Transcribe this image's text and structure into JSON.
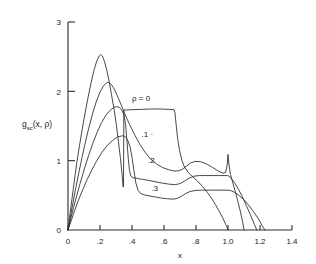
{
  "figure": {
    "background_color": "#ffffff",
    "ink_color": "#333333"
  },
  "chart_data": {
    "type": "line",
    "title": "",
    "xlabel": "x",
    "ylabel": "g_sc(x, ρ)",
    "ylabel_main": "g",
    "ylabel_subscript": "sc",
    "ylabel_args": "(x, ρ)",
    "xlim": [
      0,
      1.4
    ],
    "ylim": [
      0,
      3
    ],
    "grid": false,
    "legend_position": "inline-curve-labels",
    "xticks": [
      0,
      0.2,
      0.4,
      0.6,
      0.8,
      1.0,
      1.2,
      1.4
    ],
    "xticklabels": [
      "0",
      ".2",
      ".4",
      ".6",
      ".8",
      "1.0",
      "1.2",
      "1.4"
    ],
    "yticks": [
      0,
      1,
      2,
      3
    ],
    "yticklabels": [
      "0",
      "1",
      "2",
      "3"
    ],
    "annotations": [
      {
        "text": "ρ = 0",
        "x": 0.4,
        "y": 1.86
      },
      {
        "text": ".1 ·",
        "x": 0.46,
        "y": 1.34
      },
      {
        "text": ".2",
        "x": 0.5,
        "y": 0.97
      },
      {
        "text": ".3",
        "x": 0.52,
        "y": 0.56
      }
    ],
    "series": [
      {
        "name": "ρ = 0",
        "label": "ρ = 0",
        "peak_x": 0.205,
        "peak_y": 2.53,
        "plateau_y": 1.73,
        "plateau_x_range": [
          0.345,
          0.665
        ],
        "end_x": 1.0,
        "points": [
          [
            0.0,
            0.0
          ],
          [
            0.012,
            0.22
          ],
          [
            0.025,
            0.45
          ],
          [
            0.04,
            0.72
          ],
          [
            0.055,
            0.97
          ],
          [
            0.072,
            1.22
          ],
          [
            0.09,
            1.47
          ],
          [
            0.108,
            1.7
          ],
          [
            0.126,
            1.92
          ],
          [
            0.145,
            2.13
          ],
          [
            0.163,
            2.31
          ],
          [
            0.18,
            2.44
          ],
          [
            0.195,
            2.51
          ],
          [
            0.205,
            2.53
          ],
          [
            0.215,
            2.51
          ],
          [
            0.228,
            2.43
          ],
          [
            0.243,
            2.3
          ],
          [
            0.258,
            2.13
          ],
          [
            0.272,
            1.95
          ],
          [
            0.288,
            1.74
          ],
          [
            0.302,
            1.52
          ],
          [
            0.315,
            1.28
          ],
          [
            0.328,
            1.03
          ],
          [
            0.338,
            0.8
          ],
          [
            0.344,
            0.62
          ],
          [
            0.347,
            0.62
          ],
          [
            0.349,
            1.73
          ],
          [
            0.4,
            1.735
          ],
          [
            0.46,
            1.74
          ],
          [
            0.52,
            1.745
          ],
          [
            0.58,
            1.745
          ],
          [
            0.63,
            1.74
          ],
          [
            0.662,
            1.735
          ],
          [
            0.668,
            1.7
          ],
          [
            0.676,
            1.52
          ],
          [
            0.685,
            1.32
          ],
          [
            0.697,
            1.15
          ],
          [
            0.712,
            1.0
          ],
          [
            0.73,
            0.9
          ],
          [
            0.752,
            0.83
          ],
          [
            0.778,
            0.77
          ],
          [
            0.808,
            0.71
          ],
          [
            0.84,
            0.63
          ],
          [
            0.872,
            0.54
          ],
          [
            0.905,
            0.43
          ],
          [
            0.938,
            0.3
          ],
          [
            0.968,
            0.17
          ],
          [
            0.99,
            0.06
          ],
          [
            1.0,
            0.0
          ]
        ]
      },
      {
        "name": "ρ = .1",
        "label": ".1",
        "peak_x": 0.253,
        "peak_y": 2.13,
        "end_x": 1.1,
        "points": [
          [
            0.0,
            0.0
          ],
          [
            0.014,
            0.18
          ],
          [
            0.03,
            0.38
          ],
          [
            0.048,
            0.6
          ],
          [
            0.068,
            0.83
          ],
          [
            0.088,
            1.05
          ],
          [
            0.11,
            1.28
          ],
          [
            0.132,
            1.49
          ],
          [
            0.155,
            1.69
          ],
          [
            0.178,
            1.86
          ],
          [
            0.2,
            1.99
          ],
          [
            0.222,
            2.08
          ],
          [
            0.24,
            2.12
          ],
          [
            0.253,
            2.13
          ],
          [
            0.266,
            2.11
          ],
          [
            0.282,
            2.06
          ],
          [
            0.298,
            1.99
          ],
          [
            0.315,
            1.9
          ],
          [
            0.335,
            1.79
          ],
          [
            0.358,
            1.66
          ],
          [
            0.385,
            1.52
          ],
          [
            0.415,
            1.38
          ],
          [
            0.448,
            1.24
          ],
          [
            0.482,
            1.12
          ],
          [
            0.518,
            1.02
          ],
          [
            0.555,
            0.95
          ],
          [
            0.592,
            0.9
          ],
          [
            0.628,
            0.87
          ],
          [
            0.662,
            0.85
          ],
          [
            0.692,
            0.855
          ],
          [
            0.715,
            0.875
          ],
          [
            0.74,
            0.92
          ],
          [
            0.765,
            0.965
          ],
          [
            0.795,
            0.99
          ],
          [
            0.83,
            0.985
          ],
          [
            0.868,
            0.95
          ],
          [
            0.905,
            0.9
          ],
          [
            0.94,
            0.85
          ],
          [
            0.968,
            0.82
          ],
          [
            0.985,
            0.83
          ],
          [
            0.995,
            0.94
          ],
          [
            1.0,
            1.09
          ],
          [
            1.006,
            0.94
          ],
          [
            1.016,
            0.8
          ],
          [
            1.03,
            0.68
          ],
          [
            1.046,
            0.55
          ],
          [
            1.062,
            0.41
          ],
          [
            1.078,
            0.26
          ],
          [
            1.092,
            0.11
          ],
          [
            1.1,
            0.0
          ]
        ]
      },
      {
        "name": "ρ = .2",
        "label": ".2",
        "peak_x": 0.305,
        "peak_y": 1.78,
        "end_x": 1.18,
        "points": [
          [
            0.0,
            0.0
          ],
          [
            0.016,
            0.15
          ],
          [
            0.034,
            0.32
          ],
          [
            0.055,
            0.5
          ],
          [
            0.078,
            0.69
          ],
          [
            0.102,
            0.88
          ],
          [
            0.128,
            1.07
          ],
          [
            0.155,
            1.25
          ],
          [
            0.182,
            1.41
          ],
          [
            0.21,
            1.55
          ],
          [
            0.238,
            1.66
          ],
          [
            0.265,
            1.73
          ],
          [
            0.288,
            1.77
          ],
          [
            0.305,
            1.78
          ],
          [
            0.32,
            1.77
          ],
          [
            0.336,
            1.73
          ],
          [
            0.35,
            1.66
          ],
          [
            0.36,
            1.52
          ],
          [
            0.368,
            1.3
          ],
          [
            0.376,
            1.05
          ],
          [
            0.384,
            0.86
          ],
          [
            0.392,
            0.78
          ],
          [
            0.405,
            0.755
          ],
          [
            0.43,
            0.745
          ],
          [
            0.465,
            0.73
          ],
          [
            0.505,
            0.715
          ],
          [
            0.548,
            0.695
          ],
          [
            0.592,
            0.675
          ],
          [
            0.635,
            0.66
          ],
          [
            0.672,
            0.655
          ],
          [
            0.702,
            0.67
          ],
          [
            0.728,
            0.705
          ],
          [
            0.755,
            0.745
          ],
          [
            0.785,
            0.775
          ],
          [
            0.82,
            0.785
          ],
          [
            0.86,
            0.785
          ],
          [
            0.9,
            0.785
          ],
          [
            0.94,
            0.785
          ],
          [
            0.975,
            0.785
          ],
          [
            0.998,
            0.785
          ],
          [
            1.005,
            0.78
          ],
          [
            1.022,
            0.74
          ],
          [
            1.042,
            0.68
          ],
          [
            1.065,
            0.59
          ],
          [
            1.09,
            0.48
          ],
          [
            1.115,
            0.35
          ],
          [
            1.14,
            0.22
          ],
          [
            1.165,
            0.08
          ],
          [
            1.18,
            0.0
          ]
        ]
      },
      {
        "name": "ρ = .3",
        "label": ".3",
        "peak_x": 0.345,
        "peak_y": 1.36,
        "end_x": 1.23,
        "points": [
          [
            0.0,
            0.0
          ],
          [
            0.018,
            0.12
          ],
          [
            0.04,
            0.27
          ],
          [
            0.065,
            0.43
          ],
          [
            0.092,
            0.58
          ],
          [
            0.12,
            0.73
          ],
          [
            0.15,
            0.87
          ],
          [
            0.18,
            1.0
          ],
          [
            0.212,
            1.12
          ],
          [
            0.245,
            1.22
          ],
          [
            0.278,
            1.29
          ],
          [
            0.308,
            1.34
          ],
          [
            0.332,
            1.355
          ],
          [
            0.345,
            1.36
          ],
          [
            0.358,
            1.345
          ],
          [
            0.372,
            1.3
          ],
          [
            0.388,
            1.2
          ],
          [
            0.4,
            1.05
          ],
          [
            0.412,
            0.86
          ],
          [
            0.424,
            0.68
          ],
          [
            0.438,
            0.57
          ],
          [
            0.455,
            0.525
          ],
          [
            0.48,
            0.505
          ],
          [
            0.512,
            0.49
          ],
          [
            0.548,
            0.475
          ],
          [
            0.585,
            0.46
          ],
          [
            0.622,
            0.45
          ],
          [
            0.655,
            0.445
          ],
          [
            0.682,
            0.455
          ],
          [
            0.708,
            0.485
          ],
          [
            0.735,
            0.525
          ],
          [
            0.762,
            0.555
          ],
          [
            0.795,
            0.57
          ],
          [
            0.835,
            0.575
          ],
          [
            0.88,
            0.575
          ],
          [
            0.925,
            0.575
          ],
          [
            0.968,
            0.575
          ],
          [
            1.0,
            0.575
          ],
          [
            1.015,
            0.57
          ],
          [
            1.04,
            0.545
          ],
          [
            1.068,
            0.5
          ],
          [
            1.098,
            0.44
          ],
          [
            1.128,
            0.36
          ],
          [
            1.158,
            0.27
          ],
          [
            1.188,
            0.17
          ],
          [
            1.212,
            0.07
          ],
          [
            1.23,
            0.0
          ]
        ]
      }
    ]
  }
}
